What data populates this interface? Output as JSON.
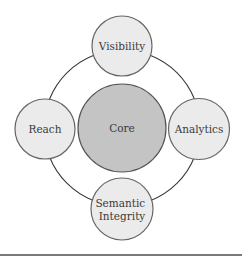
{
  "diagram": {
    "type": "hub-and-ring",
    "ring": {
      "cx": 122,
      "cy": 128,
      "r": 78,
      "stroke": "#3a3a3a"
    },
    "core": {
      "label": "Core",
      "cx": 122,
      "cy": 128,
      "r": 44,
      "fill": "#c4c4c4",
      "stroke": "#555555"
    },
    "nodes": [
      {
        "id": "visibility",
        "label_lines": [
          "Visibility"
        ],
        "cx": 122,
        "cy": 46,
        "r": 30,
        "fill": "#ebebeb",
        "stroke": "#666666"
      },
      {
        "id": "analytics",
        "label_lines": [
          "Analytics"
        ],
        "cx": 199,
        "cy": 129,
        "r": 30.5,
        "fill": "#ebebeb",
        "stroke": "#666666"
      },
      {
        "id": "semantic-integrity",
        "label_lines": [
          "Semantic",
          "Integrity"
        ],
        "cx": 122,
        "cy": 209,
        "r": 31,
        "fill": "#ebebeb",
        "stroke": "#666666"
      },
      {
        "id": "reach",
        "label_lines": [
          "Reach"
        ],
        "cx": 45,
        "cy": 129,
        "r": 30,
        "fill": "#ebebeb",
        "stroke": "#666666"
      }
    ]
  }
}
